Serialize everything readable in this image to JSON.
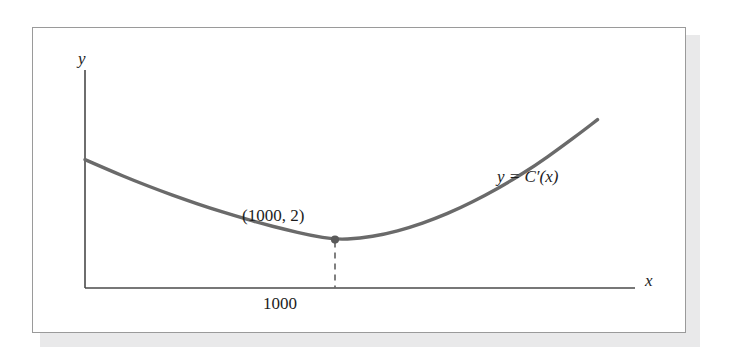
{
  "figure": {
    "kind": "textbook-figure",
    "background_color": "#ffffff",
    "frame_color": "#9a9a9a",
    "shadow_color": "#e9e9ea"
  },
  "labels": {
    "y_axis": "y",
    "x_axis": "x",
    "curve": "y = C′(x)",
    "point": "(1000, 2)",
    "tick_1000": "1000"
  },
  "colors": {
    "curve": "#6a6a6a",
    "axis": "#4a4a4a",
    "point": "#5a5a5a",
    "dashed": "#6a6a6a",
    "text": "#1d1d1d"
  },
  "chart_data": {
    "type": "line",
    "title": "",
    "subtitle": "",
    "xlabel": "x",
    "ylabel": "y",
    "grid": false,
    "legend": "none",
    "annotations": [
      {
        "name": "curve-label",
        "text": "y = C′(x)",
        "x": 1800,
        "y": 5.6
      },
      {
        "name": "minimum-point-label",
        "text": "(1000, 2)",
        "x": 1000,
        "y": 2
      },
      {
        "name": "x-tick-1000",
        "text": "1000",
        "x": 1000,
        "y": 0
      }
    ],
    "marked_points": [
      {
        "label": "(1000, 2)",
        "x": 1000,
        "y": 2,
        "kind": "minimum"
      }
    ],
    "dropline": {
      "from": [
        1000,
        2
      ],
      "to": [
        1000,
        0
      ],
      "style": "dashed"
    },
    "xlim": [
      0,
      2200
    ],
    "ylim": [
      0,
      9
    ],
    "x_ticks": [
      1000
    ],
    "y_ticks": [],
    "series": [
      {
        "name": "y = C'(x)",
        "color": "#6a6a6a",
        "x": [
          0,
          100,
          200,
          300,
          400,
          500,
          600,
          700,
          800,
          900,
          1000,
          1100,
          1200,
          1300,
          1400,
          1500,
          1600,
          1700,
          1800,
          1900,
          2000,
          2050
        ],
        "y": [
          5.3,
          4.85,
          4.42,
          4.02,
          3.65,
          3.3,
          2.98,
          2.68,
          2.42,
          2.18,
          2.0,
          2.05,
          2.22,
          2.5,
          2.86,
          3.3,
          3.82,
          4.4,
          5.05,
          5.78,
          6.55,
          6.95
        ]
      }
    ]
  },
  "geometry": {
    "axis_origin_px": [
      85,
      288
    ],
    "y_axis_top_px": [
      85,
      70
    ],
    "x_axis_right_px": [
      635,
      288
    ],
    "curve_start_px": [
      85,
      172
    ],
    "curve_min_px": [
      288,
      239
    ],
    "curve_end_px": [
      585,
      125
    ]
  }
}
